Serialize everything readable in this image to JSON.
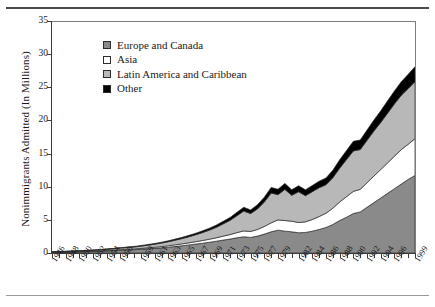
{
  "chart_data": {
    "type": "area",
    "stacked": true,
    "title": "",
    "xlabel": "",
    "ylabel": "Nonimmigrants Admitted (In Millions)",
    "ylim": [
      0,
      35
    ],
    "yticks": [
      0,
      5,
      10,
      15,
      20,
      25,
      30,
      35
    ],
    "grid": false,
    "legend_position": "upper-left-inside",
    "x": [
      1946,
      1947,
      1948,
      1949,
      1950,
      1951,
      1952,
      1953,
      1954,
      1955,
      1956,
      1957,
      1958,
      1959,
      1960,
      1961,
      1962,
      1963,
      1964,
      1965,
      1966,
      1967,
      1968,
      1969,
      1970,
      1971,
      1972,
      1973,
      1974,
      1975,
      1976,
      1977,
      1978,
      1979,
      1980,
      1981,
      1982,
      1983,
      1984,
      1985,
      1986,
      1987,
      1988,
      1989,
      1990,
      1991,
      1992,
      1993,
      1994,
      1995,
      1996,
      1997,
      1998,
      1999
    ],
    "xtick_labels": [
      "1946",
      "1948",
      "1950",
      "1952",
      "1954",
      "1956",
      "1959",
      "1961",
      "1963",
      "1965",
      "1967",
      "1969",
      "1971",
      "1973",
      "1975",
      "1977",
      "1979",
      "1982",
      "1984",
      "1986",
      "1988",
      "1990",
      "1992",
      "1994",
      "1996",
      "1999"
    ],
    "xtick_years": [
      1946,
      1948,
      1950,
      1952,
      1954,
      1956,
      1959,
      1961,
      1963,
      1965,
      1967,
      1969,
      1971,
      1973,
      1975,
      1977,
      1979,
      1982,
      1984,
      1986,
      1988,
      1990,
      1992,
      1994,
      1996,
      1999
    ],
    "series": [
      {
        "name": "Europe and Canada",
        "color": "#8a8a8a",
        "values": [
          0.1,
          0.12,
          0.14,
          0.16,
          0.18,
          0.21,
          0.24,
          0.27,
          0.31,
          0.36,
          0.41,
          0.46,
          0.5,
          0.56,
          0.63,
          0.7,
          0.78,
          0.88,
          0.99,
          1.1,
          1.22,
          1.35,
          1.48,
          1.62,
          1.78,
          1.95,
          2.1,
          2.3,
          2.45,
          2.35,
          2.55,
          2.85,
          3.2,
          3.45,
          3.3,
          3.2,
          3.05,
          3.1,
          3.3,
          3.55,
          3.85,
          4.3,
          4.9,
          5.4,
          5.95,
          6.2,
          6.9,
          7.6,
          8.3,
          9.0,
          9.7,
          10.4,
          11.1,
          11.7
        ]
      },
      {
        "name": "Asia",
        "color": "#ffffff",
        "values": [
          0.02,
          0.02,
          0.03,
          0.03,
          0.04,
          0.04,
          0.05,
          0.06,
          0.07,
          0.08,
          0.09,
          0.1,
          0.11,
          0.13,
          0.15,
          0.17,
          0.19,
          0.22,
          0.25,
          0.28,
          0.32,
          0.36,
          0.41,
          0.46,
          0.52,
          0.6,
          0.68,
          0.78,
          0.88,
          0.9,
          1.0,
          1.15,
          1.35,
          1.55,
          1.6,
          1.6,
          1.55,
          1.6,
          1.75,
          1.95,
          2.15,
          2.45,
          2.8,
          3.1,
          3.35,
          3.4,
          3.7,
          4.0,
          4.3,
          4.6,
          4.9,
          5.2,
          5.3,
          5.55
        ]
      },
      {
        "name": "Latin America and Caribbean",
        "color": "#b8b8b8",
        "values": [
          0.05,
          0.06,
          0.07,
          0.08,
          0.1,
          0.11,
          0.13,
          0.15,
          0.18,
          0.21,
          0.24,
          0.27,
          0.3,
          0.35,
          0.4,
          0.46,
          0.53,
          0.61,
          0.7,
          0.8,
          0.92,
          1.05,
          1.2,
          1.38,
          1.58,
          1.85,
          2.15,
          2.55,
          3.0,
          2.7,
          3.1,
          3.7,
          4.5,
          3.8,
          4.7,
          3.9,
          4.65,
          3.95,
          4.2,
          4.35,
          4.3,
          4.6,
          5.1,
          5.6,
          6.1,
          6.0,
          6.4,
          6.8,
          7.1,
          7.5,
          7.9,
          8.2,
          8.4,
          8.6
        ]
      },
      {
        "name": "Other",
        "color": "#000000",
        "values": [
          0.02,
          0.02,
          0.02,
          0.03,
          0.03,
          0.03,
          0.04,
          0.04,
          0.05,
          0.05,
          0.06,
          0.07,
          0.08,
          0.09,
          0.1,
          0.11,
          0.13,
          0.14,
          0.16,
          0.18,
          0.2,
          0.23,
          0.26,
          0.29,
          0.33,
          0.38,
          0.43,
          0.5,
          0.57,
          0.55,
          0.62,
          0.72,
          0.85,
          0.82,
          0.9,
          0.85,
          0.9,
          0.88,
          0.92,
          0.98,
          1.02,
          1.12,
          1.25,
          1.35,
          1.45,
          1.45,
          1.55,
          1.65,
          1.75,
          1.85,
          1.95,
          2.05,
          2.15,
          2.25
        ]
      }
    ]
  },
  "legend": {
    "items": [
      {
        "label": "Europe and Canada",
        "color": "#8a8a8a"
      },
      {
        "label": "Asia",
        "color": "#ffffff"
      },
      {
        "label": "Latin America and Caribbean",
        "color": "#b8b8b8"
      },
      {
        "label": "Other",
        "color": "#000000"
      }
    ]
  }
}
